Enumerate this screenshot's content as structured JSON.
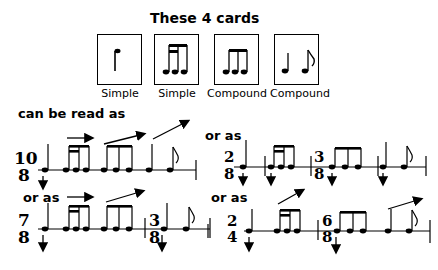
{
  "title": "These 4 cards",
  "cards": [
    {
      "label": "Simple",
      "icon": "quarter-note-card"
    },
    {
      "label": "Simple",
      "icon": "sixteenth-sixteenth-eighth-card"
    },
    {
      "label": "Compound",
      "icon": "three-eighths-card"
    },
    {
      "label": "Compound",
      "icon": "quarter-eighth-card"
    }
  ],
  "captions": {
    "can_be_read_as": "can be read as",
    "or_as_1": "or as",
    "or_as_2": "or as",
    "or_as_3": "or as"
  },
  "examples": [
    {
      "name": "example-10-8",
      "meters": [
        {
          "num": "10",
          "den": "8"
        }
      ]
    },
    {
      "name": "example-2-8-3-8",
      "meters": [
        {
          "num": "2",
          "den": "8"
        },
        {
          "num": "3",
          "den": "8"
        }
      ]
    },
    {
      "name": "example-7-8-3-8",
      "meters": [
        {
          "num": "7",
          "den": "8"
        },
        {
          "num": "3",
          "den": "8"
        }
      ]
    },
    {
      "name": "example-2-4-6-8",
      "meters": [
        {
          "num": "2",
          "den": "4"
        },
        {
          "num": "6",
          "den": "8"
        }
      ]
    }
  ]
}
